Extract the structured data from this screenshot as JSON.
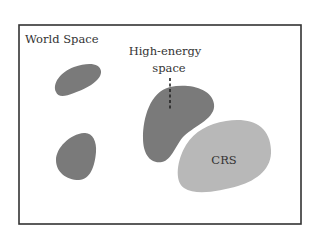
{
  "diagram": {
    "frame_label": "World Space",
    "high_energy_label_line1": "High-energy",
    "high_energy_label_line2": "space",
    "crs_label": "CRS",
    "colors": {
      "frame": "#333333",
      "high_energy_region": "#7a7a7a",
      "crs_region": "#b8b8b8",
      "text": "#333333"
    },
    "regions": [
      {
        "name": "high-energy-region-top-left",
        "kind": "high-energy"
      },
      {
        "name": "high-energy-region-bottom-left",
        "kind": "high-energy"
      },
      {
        "name": "high-energy-region-center",
        "kind": "high-energy"
      },
      {
        "name": "crs-region",
        "kind": "crs"
      }
    ]
  }
}
